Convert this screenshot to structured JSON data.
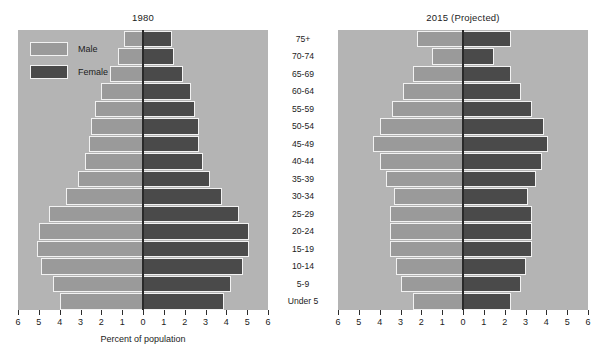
{
  "figure": {
    "xlabel": "Percent of population",
    "legend": {
      "male_label": "Male",
      "female_label": "Female",
      "male_color": "#9a9a9a",
      "female_color": "#4a4a4a"
    },
    "panel_background": "#b4b4b4",
    "page_background": "#ffffff"
  },
  "chart_data": {
    "type": "bar",
    "subtype": "population-pyramid",
    "title": "",
    "xlabel": "Percent of population",
    "ylabel": "",
    "xlim": [
      -6,
      6
    ],
    "xticks": [
      6,
      5,
      4,
      3,
      2,
      1,
      0,
      1,
      2,
      3,
      4,
      5,
      6
    ],
    "xtick_labels": [
      "6",
      "5",
      "4",
      "3",
      "2",
      "1",
      "0",
      "1",
      "2",
      "3",
      "4",
      "5",
      "6"
    ],
    "grid": false,
    "legend_position": "upper-left",
    "categories": [
      "75+",
      "70-74",
      "65-69",
      "60-64",
      "55-59",
      "50-54",
      "45-49",
      "40-44",
      "35-39",
      "30-34",
      "25-29",
      "20-24",
      "15-19",
      "10-14",
      "5-9",
      "Under 5"
    ],
    "panels": [
      {
        "title": "1980",
        "series": [
          {
            "name": "Male",
            "side": "left",
            "color": "#9a9a9a",
            "values": [
              0.9,
              1.2,
              1.6,
              2.0,
              2.3,
              2.5,
              2.6,
              2.8,
              3.1,
              3.7,
              4.5,
              5.0,
              5.1,
              4.9,
              4.3,
              4.0
            ]
          },
          {
            "name": "Female",
            "side": "right",
            "color": "#4a4a4a",
            "values": [
              1.4,
              1.5,
              1.9,
              2.3,
              2.5,
              2.7,
              2.7,
              2.9,
              3.2,
              3.8,
              4.6,
              5.1,
              5.1,
              4.8,
              4.2,
              3.9
            ]
          }
        ]
      },
      {
        "title": "2015 (Projected)",
        "series": [
          {
            "name": "Male",
            "side": "left",
            "color": "#9a9a9a",
            "values": [
              2.2,
              1.5,
              2.4,
              2.9,
              3.4,
              4.0,
              4.3,
              4.0,
              3.7,
              3.3,
              3.5,
              3.5,
              3.5,
              3.2,
              3.0,
              2.4
            ]
          },
          {
            "name": "Female",
            "side": "right",
            "color": "#4a4a4a",
            "values": [
              2.3,
              1.5,
              2.3,
              2.8,
              3.3,
              3.9,
              4.1,
              3.8,
              3.5,
              3.1,
              3.3,
              3.3,
              3.3,
              3.0,
              2.8,
              2.3
            ]
          }
        ]
      }
    ]
  }
}
